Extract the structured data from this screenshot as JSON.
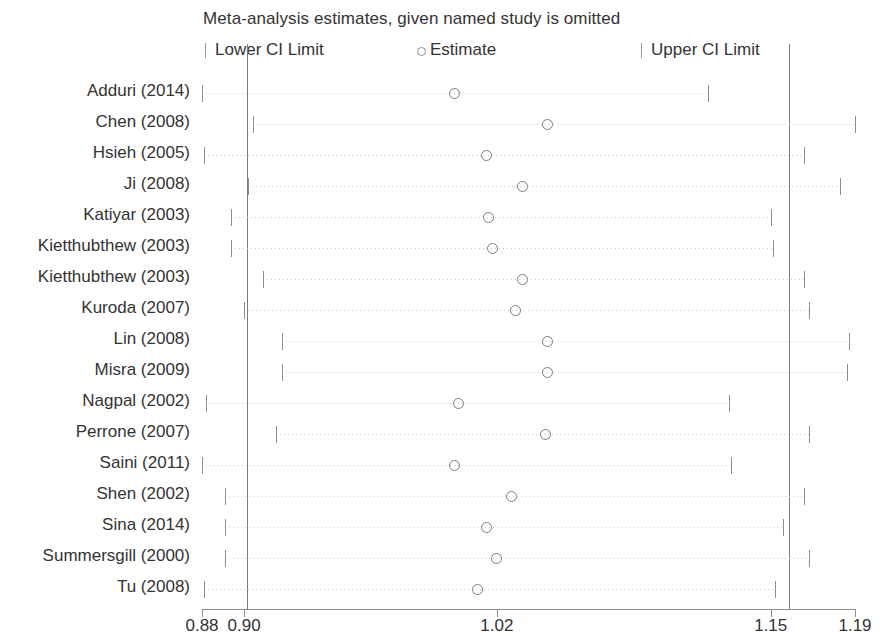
{
  "title": "Meta-analysis estimates, given named study is omitted",
  "legend": {
    "lower": "Lower CI Limit",
    "estimate": "Estimate",
    "upper": "Upper CI Limit"
  },
  "axis": {
    "ticks": [
      "0.88",
      "0.90",
      "1.02",
      "1.15",
      "1.19"
    ],
    "tick_values": [
      0.88,
      0.9,
      1.02,
      1.15,
      1.19
    ],
    "min": 0.88,
    "max": 1.19
  },
  "reference_lines": [
    0.9,
    1.15
  ],
  "chart_data": {
    "type": "scatter",
    "title": "Meta-analysis estimates, given named study is omitted",
    "xlabel": "",
    "ylabel": "",
    "xlim": [
      0.88,
      1.19
    ],
    "grid": false,
    "legend_position": "top",
    "legend_entries": [
      "Lower CI Limit",
      "Estimate",
      "Upper CI Limit"
    ],
    "categories": [
      "Adduri (2014)",
      "Chen (2008)",
      "Hsieh (2005)",
      "Ji (2008)",
      "Katiyar (2003)",
      "Kietthubthew (2003)",
      "Kietthubthew (2003)",
      "Kuroda (2007)",
      "Lin (2008)",
      "Misra (2009)",
      "Nagpal (2002)",
      "Perrone (2007)",
      "Saini (2011)",
      "Shen (2002)",
      "Sina (2014)",
      "Summersgill (2000)",
      "Tu (2008)"
    ],
    "series": [
      {
        "name": "Lower CI Limit",
        "values": [
          0.88,
          0.904,
          0.881,
          0.902,
          0.894,
          0.894,
          0.909,
          0.9,
          0.918,
          0.918,
          0.882,
          0.915,
          0.88,
          0.891,
          0.891,
          0.891,
          0.881
        ]
      },
      {
        "name": "Estimate",
        "values": [
          1.0,
          1.044,
          1.015,
          1.032,
          1.016,
          1.018,
          1.032,
          1.029,
          1.044,
          1.044,
          1.002,
          1.043,
          1.0,
          1.027,
          1.015,
          1.02,
          1.011
        ]
      },
      {
        "name": "Upper CI Limit",
        "values": [
          1.12,
          1.19,
          1.166,
          1.183,
          1.15,
          1.151,
          1.166,
          1.168,
          1.187,
          1.186,
          1.13,
          1.168,
          1.131,
          1.166,
          1.156,
          1.168,
          1.152
        ]
      }
    ],
    "rows": [
      {
        "label": "Adduri (2014)",
        "lower": 0.88,
        "estimate": 1.0,
        "upper": 1.12
      },
      {
        "label": "Chen (2008)",
        "lower": 0.904,
        "estimate": 1.044,
        "upper": 1.19
      },
      {
        "label": "Hsieh (2005)",
        "lower": 0.881,
        "estimate": 1.015,
        "upper": 1.166
      },
      {
        "label": "Ji (2008)",
        "lower": 0.902,
        "estimate": 1.032,
        "upper": 1.183
      },
      {
        "label": "Katiyar (2003)",
        "lower": 0.894,
        "estimate": 1.016,
        "upper": 1.15
      },
      {
        "label": "Kietthubthew (2003)",
        "lower": 0.894,
        "estimate": 1.018,
        "upper": 1.151
      },
      {
        "label": "Kietthubthew (2003)",
        "lower": 0.909,
        "estimate": 1.032,
        "upper": 1.166
      },
      {
        "label": "Kuroda (2007)",
        "lower": 0.9,
        "estimate": 1.029,
        "upper": 1.168
      },
      {
        "label": "Lin (2008)",
        "lower": 0.918,
        "estimate": 1.044,
        "upper": 1.187
      },
      {
        "label": "Misra (2009)",
        "lower": 0.918,
        "estimate": 1.044,
        "upper": 1.186
      },
      {
        "label": "Nagpal (2002)",
        "lower": 0.882,
        "estimate": 1.002,
        "upper": 1.13
      },
      {
        "label": "Perrone (2007)",
        "lower": 0.915,
        "estimate": 1.043,
        "upper": 1.168
      },
      {
        "label": "Saini (2011)",
        "lower": 0.88,
        "estimate": 1.0,
        "upper": 1.131
      },
      {
        "label": "Shen (2002)",
        "lower": 0.891,
        "estimate": 1.027,
        "upper": 1.166
      },
      {
        "label": "Sina (2014)",
        "lower": 0.891,
        "estimate": 1.015,
        "upper": 1.156
      },
      {
        "label": "Summersgill (2000)",
        "lower": 0.891,
        "estimate": 1.02,
        "upper": 1.168
      },
      {
        "label": "Tu (2008)",
        "lower": 0.881,
        "estimate": 1.011,
        "upper": 1.152
      }
    ]
  }
}
